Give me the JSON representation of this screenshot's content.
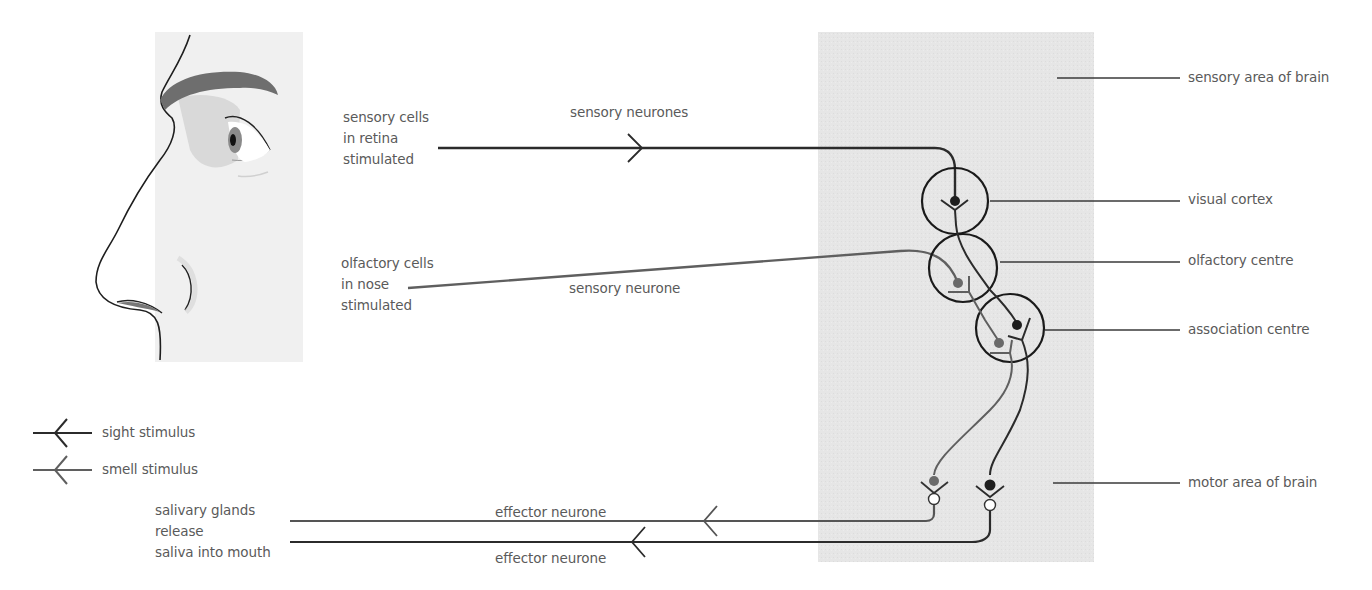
{
  "colors": {
    "sight": "#2b2b2b",
    "smell": "#6b6b6b",
    "brain_area": "#e4e4e4",
    "face_panel": "#efefef",
    "eyebrow": "#6a6a6a",
    "text": "#5a5a5a"
  },
  "stimuli": {
    "sight": {
      "lines": [
        "sensory cells",
        "in retina",
        "stimulated"
      ],
      "pathway_label": "sensory neurones"
    },
    "smell": {
      "lines": [
        "olfactory cells",
        "in nose",
        "stimulated"
      ],
      "pathway_label": "sensory neurone"
    }
  },
  "brain_labels": {
    "sensory_area": "sensory area of brain",
    "visual_cortex": "visual cortex",
    "olfactory_centre": "olfactory centre",
    "association_centre": "association centre",
    "motor_area": "motor area of brain"
  },
  "legend": {
    "items": [
      {
        "label": "sight stimulus",
        "icon": "arrow-left-dark-icon"
      },
      {
        "label": "smell stimulus",
        "icon": "arrow-left-grey-icon"
      }
    ]
  },
  "response": {
    "lines": [
      "salivary glands",
      "release",
      "saliva into mouth"
    ],
    "effector_label_1": "effector neurone",
    "effector_label_2": "effector neurone"
  }
}
